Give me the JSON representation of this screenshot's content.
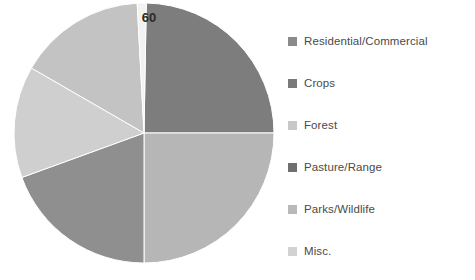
{
  "chart_data": {
    "type": "pie",
    "title": "",
    "labels": [
      "Residential/Commercial",
      "Crops",
      "Forest",
      "Pasture/Range",
      "Parks/Wildlife",
      "Misc."
    ],
    "values": [
      25,
      25,
      17,
      23,
      9,
      1
    ],
    "data_labels": [
      "",
      "",
      "",
      "",
      "",
      "60"
    ],
    "visible_value_label": "60",
    "colors": [
      "#7d7d7d",
      "#b6b6b6",
      "#cfcfcf",
      "#8f8f8f",
      "#c3c3c3",
      "#dcdcdc"
    ],
    "legend_position": "right",
    "start_angle_deg": -2,
    "grid": false,
    "xlabel": "",
    "ylabel": ""
  },
  "legend": {
    "items": [
      {
        "label": "Residential/Commercial",
        "color": "#8a8a8a"
      },
      {
        "label": "Crops",
        "color": "#7a7a7a"
      },
      {
        "label": "Forest",
        "color": "#c8c8c8"
      },
      {
        "label": "Pasture/Range",
        "color": "#6f6f6f"
      },
      {
        "label": "Parks/Wildlife",
        "color": "#b9b9b9"
      },
      {
        "label": "Misc.",
        "color": "#d2d2d2"
      }
    ]
  },
  "pie": {
    "center_x": 144,
    "center_y": 133,
    "radius": 130,
    "slices": [
      {
        "name": "residential-commercial",
        "color": "#7d7d7d",
        "start": 1,
        "end": 90
      },
      {
        "name": "crops",
        "color": "#b6b6b6",
        "start": 90,
        "end": 180
      },
      {
        "name": "pasture-range",
        "color": "#8f8f8f",
        "start": 180,
        "end": 250
      },
      {
        "name": "forest",
        "color": "#cfcfcf",
        "start": 250,
        "end": 300
      },
      {
        "name": "parks-wildlife",
        "color": "#c3c3c3",
        "start": 300,
        "end": 357
      },
      {
        "name": "misc",
        "color": "#f2f2f2",
        "start": 357,
        "end": 361
      }
    ],
    "value_label": "60",
    "value_label_x": 149,
    "value_label_y": 22
  }
}
